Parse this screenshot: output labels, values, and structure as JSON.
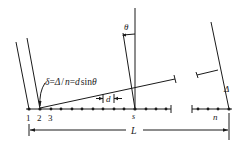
{
  "diagram": {
    "type": "phased-array-geometry",
    "formula_label": "δ = Δ / n = d sinθ",
    "formula_parts": {
      "delta_small": "δ",
      "eq1": "=",
      "delta_big": "Δ",
      "slash": "/",
      "n": "n",
      "eq2": "=",
      "d": "d",
      "sin": "sin",
      "theta": "θ"
    },
    "labels": {
      "theta": "θ",
      "spacing": "d",
      "element_s": "s",
      "element_n": "n",
      "path_difference": "Δ",
      "length": "L"
    },
    "element_numbers": [
      "1",
      "2",
      "3"
    ],
    "colors": {
      "ink": "#1a1a1a",
      "background": "#ffffff"
    }
  }
}
